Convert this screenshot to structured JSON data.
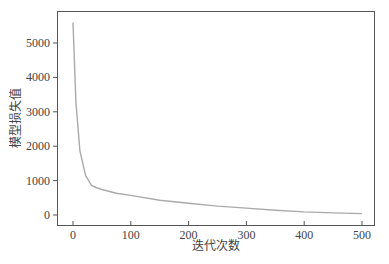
{
  "chart_data": {
    "type": "line",
    "title": "",
    "xlabel": "迭代次数",
    "ylabel": "模型损失值",
    "xlim": [
      -20,
      510
    ],
    "ylim": [
      -300,
      5900
    ],
    "xticks": [
      0,
      100,
      200,
      300,
      400,
      500
    ],
    "yticks": [
      0,
      1000,
      2000,
      3000,
      4000,
      5000
    ],
    "grid": false,
    "legend": null,
    "line_color": "#aaaaaa",
    "series": [
      {
        "name": "loss",
        "x": [
          0,
          5,
          12,
          22,
          32,
          40,
          50,
          75,
          100,
          150,
          200,
          250,
          300,
          350,
          400,
          450,
          500
        ],
        "y": [
          5600,
          3290,
          1860,
          1140,
          860,
          800,
          740,
          630,
          570,
          430,
          340,
          260,
          200,
          140,
          90,
          60,
          40
        ]
      }
    ]
  }
}
